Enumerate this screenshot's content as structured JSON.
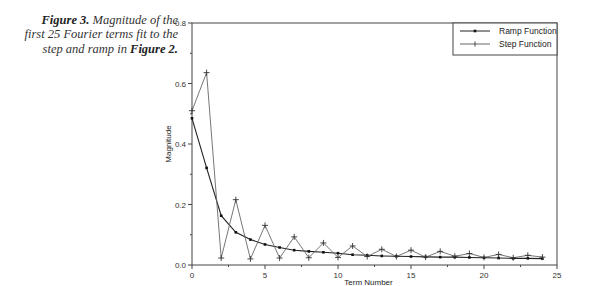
{
  "caption": {
    "label": "Figure 3.",
    "text": " Magnitude of the first 25 Fourier terms fit to the step and ramp in ",
    "ref": "Figure 2."
  },
  "chart_data": {
    "type": "line",
    "title": "",
    "xlabel": "Term Number",
    "ylabel": "Magnitude",
    "xlim": [
      0,
      25
    ],
    "ylim": [
      0,
      0.8
    ],
    "x_ticks": [
      "0",
      "5",
      "10",
      "15",
      "20",
      "25"
    ],
    "y_ticks": [
      "0.0",
      "0.2",
      "0.4",
      "0.6",
      "0.8"
    ],
    "grid": false,
    "legend_position": "upper right",
    "x": [
      0,
      1,
      2,
      3,
      4,
      5,
      6,
      7,
      8,
      9,
      10,
      11,
      12,
      13,
      14,
      15,
      16,
      17,
      18,
      19,
      20,
      21,
      22,
      23,
      24
    ],
    "series": [
      {
        "name": "Ramp Function",
        "marker": "dot",
        "values": [
          0.485,
          0.321,
          0.163,
          0.108,
          0.084,
          0.068,
          0.058,
          0.049,
          0.045,
          0.042,
          0.039,
          0.034,
          0.032,
          0.03,
          0.029,
          0.028,
          0.027,
          0.026,
          0.026,
          0.025,
          0.024,
          0.023,
          0.022,
          0.022,
          0.021
        ]
      },
      {
        "name": "Step Function",
        "marker": "plus",
        "values": [
          0.51,
          0.636,
          0.023,
          0.216,
          0.02,
          0.131,
          0.023,
          0.093,
          0.024,
          0.073,
          0.025,
          0.063,
          0.028,
          0.052,
          0.028,
          0.049,
          0.026,
          0.045,
          0.029,
          0.038,
          0.025,
          0.035,
          0.024,
          0.032,
          0.026
        ]
      }
    ]
  }
}
